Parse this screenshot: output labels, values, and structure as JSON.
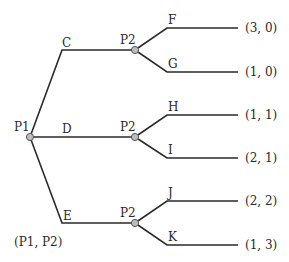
{
  "root": {
    "player": "P1",
    "x": 30,
    "y": 137
  },
  "actions_p1": [
    {
      "label": "C",
      "corner": [
        62,
        50
      ],
      "node": [
        135,
        50
      ],
      "label_pos": [
        62,
        37
      ]
    },
    {
      "label": "D",
      "corner": [
        62,
        137
      ],
      "node": [
        135,
        137
      ],
      "label_pos": [
        62,
        123
      ]
    },
    {
      "label": "E",
      "corner": [
        62,
        223
      ],
      "node": [
        135,
        223
      ],
      "label_pos": [
        63,
        210
      ]
    }
  ],
  "p2_nodes": [
    {
      "player": "P2",
      "x": 135,
      "y": 50
    },
    {
      "player": "P2",
      "x": 135,
      "y": 137
    },
    {
      "player": "P2",
      "x": 135,
      "y": 223
    }
  ],
  "actions_p2": [
    {
      "label": "F",
      "from": 0,
      "corner": [
        167,
        28
      ],
      "end": [
        238,
        28
      ],
      "payoff": "(3, 0)"
    },
    {
      "label": "G",
      "from": 0,
      "corner": [
        167,
        72
      ],
      "end": [
        238,
        72
      ],
      "payoff": "(1, 0)"
    },
    {
      "label": "H",
      "from": 1,
      "corner": [
        167,
        115
      ],
      "end": [
        238,
        115
      ],
      "payoff": "(1, 1)"
    },
    {
      "label": "I",
      "from": 1,
      "corner": [
        167,
        158
      ],
      "end": [
        238,
        158
      ],
      "payoff": "(2, 1)"
    },
    {
      "label": "J",
      "from": 2,
      "corner": [
        167,
        201
      ],
      "end": [
        238,
        201
      ],
      "payoff": "(2, 2)"
    },
    {
      "label": "K",
      "from": 2,
      "corner": [
        167,
        245
      ],
      "end": [
        238,
        245
      ],
      "payoff": "(1, 3)"
    }
  ],
  "legend": "(P1, P2)",
  "colors": {
    "line": "#2a2a2a",
    "node_fill": "#bdbdbd",
    "node_stroke": "#555555"
  }
}
